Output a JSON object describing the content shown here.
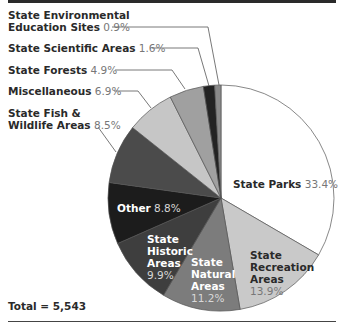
{
  "chart_data": {
    "type": "pie",
    "title": "",
    "start_angle": "top, clockwise",
    "total_label": "Total = 5,543",
    "total": 5543,
    "slices": [
      {
        "label": "State Parks",
        "value": 33.4,
        "pct": "33.4%",
        "color": "#ffffff"
      },
      {
        "label": "State Recreation Areas",
        "value": 13.9,
        "pct": "13.9%",
        "color": "#c9c9c9"
      },
      {
        "label": "State Natural Areas",
        "value": 11.2,
        "pct": "11.2%",
        "color": "#7c7c7c"
      },
      {
        "label": "State Historic Areas",
        "value": 9.9,
        "pct": "9.9%",
        "color": "#3e3e3e"
      },
      {
        "label": "Other",
        "value": 8.8,
        "pct": "8.8%",
        "color": "#1c1c1c"
      },
      {
        "label": "State Fish & Wildlife Areas",
        "value": 8.5,
        "pct": "8.5%",
        "color": "#4b4b4b"
      },
      {
        "label": "Miscellaneous",
        "value": 6.9,
        "pct": "6.9%",
        "color": "#c6c6c6"
      },
      {
        "label": "State Forests",
        "value": 4.9,
        "pct": "4.9%",
        "color": "#a0a0a0"
      },
      {
        "label": "State Scientific Areas",
        "value": 1.6,
        "pct": "1.6%",
        "color": "#232323"
      },
      {
        "label": "State Environmental Education Sites",
        "value": 0.9,
        "pct": "0.9%",
        "color": "#8a8a8a"
      }
    ]
  },
  "labels": {
    "env_ed": {
      "line1": "State Environmental",
      "line2": "Education Sites",
      "pct": "0.9%"
    },
    "scientific": {
      "name": "State Scientific Areas",
      "pct": "1.6%"
    },
    "forests": {
      "name": "State Forests",
      "pct": "4.9%"
    },
    "misc": {
      "name": "Miscellaneous",
      "pct": "6.9%"
    },
    "fish": {
      "line1": "State Fish &",
      "line2": "Wildlife Areas",
      "pct": "8.5%"
    },
    "other": {
      "name": "Other",
      "pct": "8.8%"
    },
    "historic": {
      "line1": "State",
      "line2": "Historic",
      "line3": "Areas",
      "pct": "9.9%"
    },
    "natural": {
      "line1": "State",
      "line2": "Natural",
      "line3": "Areas",
      "pct": "11.2%"
    },
    "recreation": {
      "line1": "State",
      "line2": "Recreation",
      "line3": "Areas",
      "pct": "13.9%"
    },
    "parks": {
      "name": "State Parks",
      "pct": "33.4%"
    }
  },
  "footer": {
    "total": "Total = 5,543"
  }
}
